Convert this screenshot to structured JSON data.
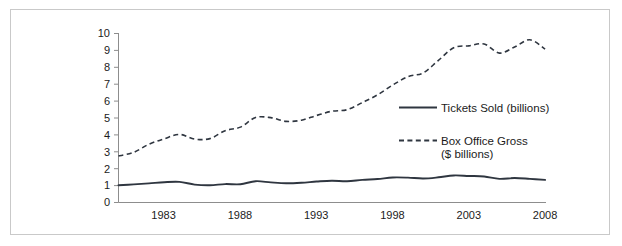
{
  "figure": {
    "background_color": "#ffffff",
    "frame_color": "#c9c9c9",
    "axis_color": "#8d8d8d",
    "ink_color": "#2f3640"
  },
  "chart_data": {
    "type": "line",
    "title": "",
    "subtitle": "",
    "xlabel": "",
    "ylabel": "",
    "xlim": [
      1980,
      2008
    ],
    "ylim": [
      0,
      10
    ],
    "grid": false,
    "legend_position": "inside-right",
    "x_tick_labels": [
      "1983",
      "1988",
      "1993",
      "1998",
      "2003",
      "2008"
    ],
    "x_tick_values": [
      1983,
      1988,
      1993,
      1998,
      2003,
      2008
    ],
    "y_tick_labels": [
      "0",
      "1",
      "2",
      "3",
      "4",
      "5",
      "6",
      "7",
      "8",
      "9",
      "10"
    ],
    "y_tick_values": [
      0,
      1,
      2,
      3,
      4,
      5,
      6,
      7,
      8,
      9,
      10
    ],
    "x": [
      1980,
      1981,
      1982,
      1983,
      1984,
      1985,
      1986,
      1987,
      1988,
      1989,
      1990,
      1991,
      1992,
      1993,
      1994,
      1995,
      1996,
      1997,
      1998,
      1999,
      2000,
      2001,
      2002,
      2003,
      2004,
      2005,
      2006,
      2007,
      2008
    ],
    "series": [
      {
        "name": "Tickets Sold (billions)",
        "style": "solid",
        "color": "#2f3640",
        "values": [
          1.02,
          1.07,
          1.13,
          1.2,
          1.22,
          1.06,
          1.02,
          1.09,
          1.08,
          1.26,
          1.19,
          1.14,
          1.17,
          1.24,
          1.29,
          1.26,
          1.34,
          1.39,
          1.48,
          1.47,
          1.42,
          1.49,
          1.6,
          1.57,
          1.54,
          1.4,
          1.45,
          1.4,
          1.34
        ],
        "units": "billions of tickets"
      },
      {
        "name": "Box Office Gross ($ billions)",
        "style": "dashed",
        "color": "#2f3640",
        "values": [
          2.75,
          2.97,
          3.45,
          3.77,
          4.03,
          3.75,
          3.78,
          4.25,
          4.46,
          5.03,
          5.02,
          4.8,
          4.87,
          5.15,
          5.4,
          5.49,
          5.91,
          6.37,
          6.95,
          7.45,
          7.67,
          8.41,
          9.16,
          9.27,
          9.38,
          8.84,
          9.2,
          9.63,
          9.08
        ],
        "units": "billions of US dollars"
      }
    ],
    "annotations": []
  },
  "legend": {
    "entries": [
      {
        "label": "Tickets Sold (billions)",
        "style": "solid"
      },
      {
        "label": "Box Office Gross",
        "label_line2": "($ billions)",
        "style": "dashed"
      }
    ]
  }
}
